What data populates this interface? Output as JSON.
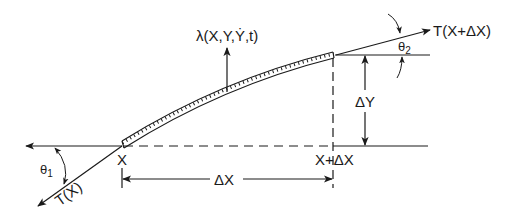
{
  "diagram": {
    "type": "string-element free-body diagram",
    "colors": {
      "line": "#1a1a1a",
      "background": "#ffffff"
    },
    "labels": {
      "load": "λ(X,Y,Ẏ,t)",
      "tension_right": "T(X+ΔX)",
      "tension_left": "T(X)",
      "theta1": "θ",
      "theta1_sub": "1",
      "theta2": "θ",
      "theta2_sub": "2",
      "delta_y": "ΔY",
      "delta_x": "ΔX",
      "x_left": "X",
      "x_right": "X+ΔX"
    },
    "elements": [
      "curved string segment (hatched) from X to X+ΔX",
      "upward load arrow λ at midpoint",
      "tension arrow T(X+ΔX) at right end at angle θ2",
      "tension arrow T(X) at left end at angle θ1",
      "horizontal reference lines at both ends",
      "vertical dimension ΔY",
      "horizontal dimension ΔX"
    ]
  }
}
